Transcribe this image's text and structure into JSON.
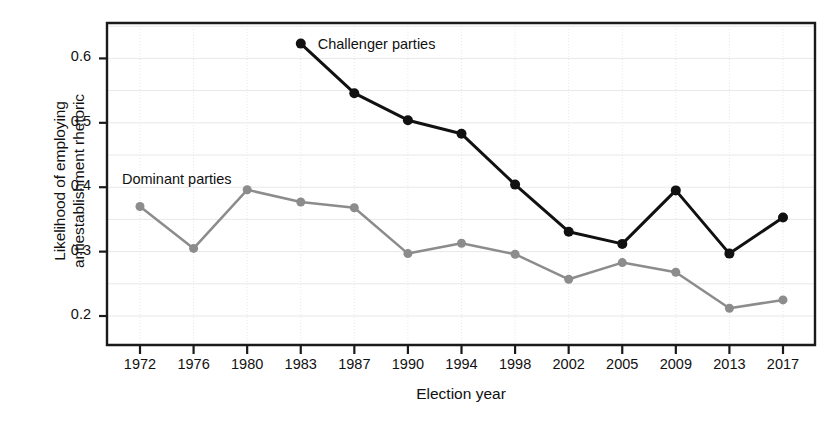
{
  "chart_data": {
    "type": "line",
    "title": "",
    "xlabel": "Election year",
    "ylabel": "Likelihood of employing\nantiestablishment rhetoric",
    "categories": [
      "1972",
      "1976",
      "1980",
      "1983",
      "1987",
      "1990",
      "1994",
      "1998",
      "2002",
      "2005",
      "2009",
      "2013",
      "2017"
    ],
    "ylim": [
      0.155,
      0.655
    ],
    "yticks": [
      0.2,
      0.3,
      0.4,
      0.5,
      0.6
    ],
    "ytick_labels": [
      "0.2",
      "0.3",
      "0.4",
      "0.5",
      "0.6"
    ],
    "grid": true,
    "grid_minor": true,
    "legend_position": "inline-annotations",
    "series": [
      {
        "name": "Challenger parties",
        "color": "#111111",
        "marker": "circle",
        "marker_size": 7,
        "line_width": 3,
        "annotation": "Challenger parties",
        "annotation_x": "1983",
        "values": [
          null,
          null,
          null,
          0.623,
          0.546,
          0.504,
          0.483,
          0.404,
          0.331,
          0.312,
          0.395,
          0.297,
          0.353
        ]
      },
      {
        "name": "Dominant parties",
        "color": "#8c8c8c",
        "marker": "circle",
        "marker_size": 6,
        "line_width": 2.5,
        "annotation": "Dominant parties",
        "annotation_x": "1972",
        "values": [
          0.37,
          0.305,
          0.396,
          0.377,
          0.368,
          0.297,
          0.313,
          0.296,
          0.257,
          0.283,
          0.268,
          0.212,
          0.225
        ]
      }
    ]
  },
  "colors": {
    "challenger": "#111111",
    "dominant": "#8c8c8c",
    "axis": "#1a1a1a",
    "grid": "#e8e8ec",
    "background": "#ffffff"
  },
  "annotations": {
    "challenger_label": "Challenger parties",
    "dominant_label": "Dominant parties"
  }
}
